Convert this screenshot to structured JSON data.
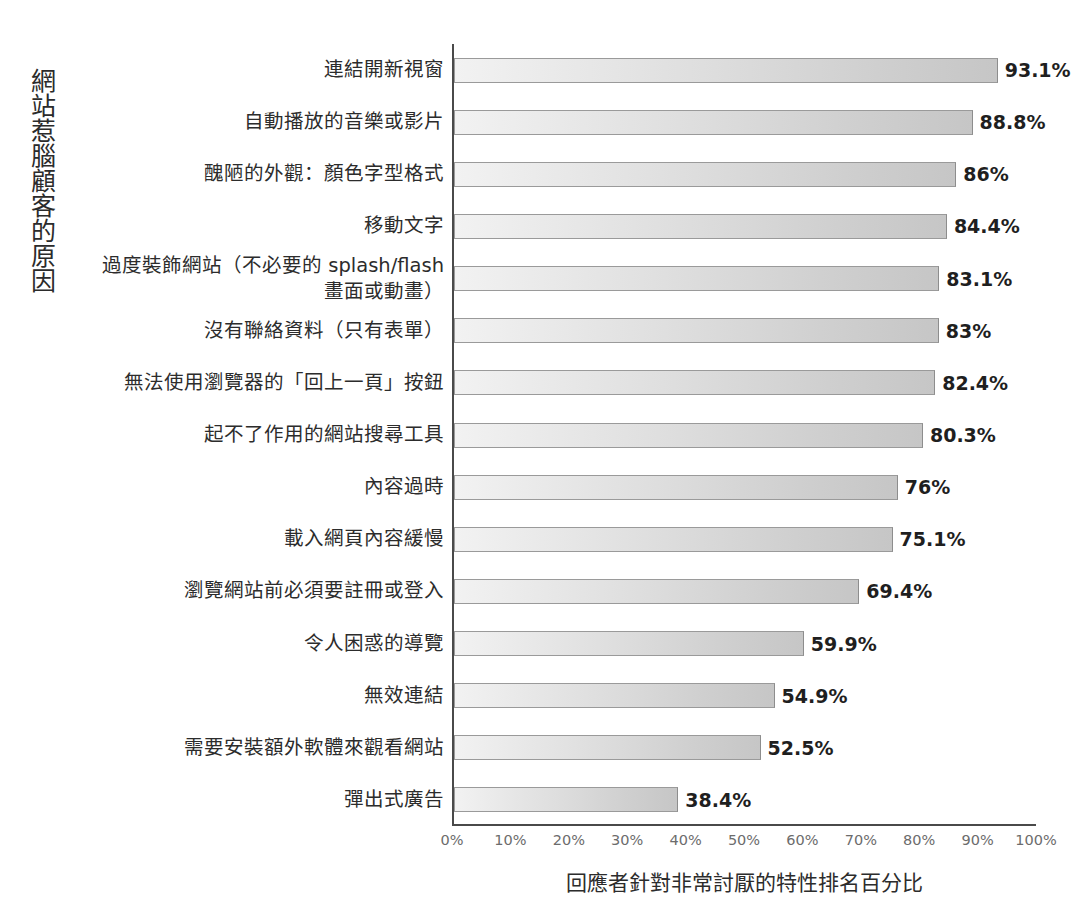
{
  "chart_data": {
    "type": "bar",
    "orientation": "horizontal",
    "title": "",
    "ylabel": "網站惹腦顧客的原因",
    "xlabel": "回應者針對非常討厭的特性排名百分比",
    "xlim": [
      0,
      100
    ],
    "xticks": [
      "0%",
      "10%",
      "20%",
      "30%",
      "40%",
      "50%",
      "60%",
      "70%",
      "80%",
      "90%",
      "100%"
    ],
    "xtick_values": [
      0,
      10,
      20,
      30,
      40,
      50,
      60,
      70,
      80,
      90,
      100
    ],
    "grid": false,
    "legend": false,
    "categories": [
      "連結開新視窗",
      "自動播放的音樂或影片",
      "醜陋的外觀：顏色字型格式",
      "移動文字",
      "過度裝飾網站（不必要的 splash/flash\n畫面或動畫）",
      "沒有聯絡資料（只有表單）",
      "無法使用瀏覽器的「回上一頁」按鈕",
      "起不了作用的網站搜尋工具",
      "內容過時",
      "載入網頁內容緩慢",
      "瀏覽網站前必須要註冊或登入",
      "令人困惑的導覽",
      "無效連結",
      "需要安裝額外軟體來觀看網站",
      "彈出式廣告"
    ],
    "values": [
      93.1,
      88.8,
      86,
      84.4,
      83.1,
      83,
      82.4,
      80.3,
      76,
      75.1,
      69.4,
      59.9,
      54.9,
      52.5,
      38.4
    ],
    "value_labels": [
      "93.1%",
      "88.8%",
      "86%",
      "84.4%",
      "83.1%",
      "83%",
      "82.4%",
      "80.3%",
      "76%",
      "75.1%",
      "69.4%",
      "59.9%",
      "54.9%",
      "52.5%",
      "38.4%"
    ],
    "colors": {
      "bar_fill_light": "#f2f2f2",
      "bar_fill_dark": "#c6c6c6",
      "bar_border": "#9a9a9a",
      "axis": "#4a4a4a",
      "tick_text": "#6c6c6c",
      "label_text": "#2c2c2c",
      "value_text": "#1f1f1f",
      "background": "#ffffff"
    }
  }
}
